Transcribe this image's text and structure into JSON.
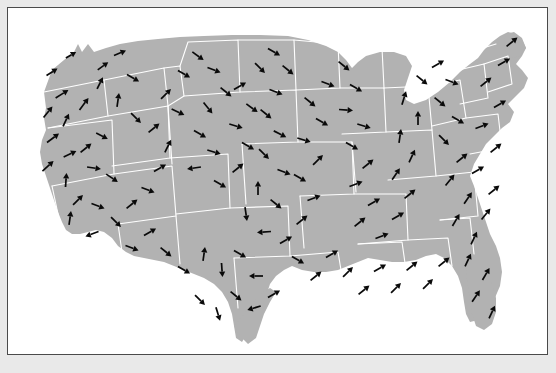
{
  "figure": {
    "title": "",
    "type": "vector-field-map",
    "region": "Contiguous United States",
    "background_color": "#e9e9e9",
    "panel_color": "#ffffff",
    "land_color": "#b2b2b2",
    "border_color": "#ffffff",
    "arrow_color": "#0a0a0a",
    "frame_color": "#4a4a4a",
    "panel": {
      "x": 7,
      "y": 7,
      "width": 541,
      "height": 348
    }
  },
  "chart_data": {
    "type": "quiver",
    "title": "",
    "xlabel": "",
    "ylabel": "",
    "legend": [],
    "grid": false,
    "units": "arbitrary vector units",
    "xlim": [
      0,
      539
    ],
    "ylim": [
      0,
      346
    ],
    "vectors": [
      {
        "x": 44,
        "y": 64,
        "dx": 11,
        "dy": -7,
        "len": 13
      },
      {
        "x": 63,
        "y": 47,
        "dx": 10,
        "dy": -6,
        "len": 12
      },
      {
        "x": 54,
        "y": 86,
        "dx": 13,
        "dy": -8,
        "len": 15
      },
      {
        "x": 40,
        "y": 104,
        "dx": 9,
        "dy": -11,
        "len": 14
      },
      {
        "x": 58,
        "y": 112,
        "dx": 6,
        "dy": -13,
        "len": 14
      },
      {
        "x": 76,
        "y": 96,
        "dx": 9,
        "dy": -12,
        "len": 15
      },
      {
        "x": 92,
        "y": 75,
        "dx": 6,
        "dy": -12,
        "len": 13
      },
      {
        "x": 95,
        "y": 58,
        "dx": 11,
        "dy": -8,
        "len": 13
      },
      {
        "x": 112,
        "y": 45,
        "dx": 12,
        "dy": -5,
        "len": 13
      },
      {
        "x": 125,
        "y": 70,
        "dx": 12,
        "dy": 7,
        "len": 14
      },
      {
        "x": 110,
        "y": 92,
        "dx": 2,
        "dy": -14,
        "len": 14
      },
      {
        "x": 128,
        "y": 110,
        "dx": 10,
        "dy": 10,
        "len": 14
      },
      {
        "x": 45,
        "y": 130,
        "dx": 12,
        "dy": -9,
        "len": 15
      },
      {
        "x": 62,
        "y": 146,
        "dx": 13,
        "dy": -6,
        "len": 14
      },
      {
        "x": 40,
        "y": 158,
        "dx": 11,
        "dy": -10,
        "len": 15
      },
      {
        "x": 58,
        "y": 172,
        "dx": 1,
        "dy": -14,
        "len": 14
      },
      {
        "x": 78,
        "y": 140,
        "dx": 11,
        "dy": -9,
        "len": 14
      },
      {
        "x": 94,
        "y": 128,
        "dx": 12,
        "dy": 6,
        "len": 13
      },
      {
        "x": 86,
        "y": 160,
        "dx": 14,
        "dy": 2,
        "len": 14
      },
      {
        "x": 104,
        "y": 170,
        "dx": 12,
        "dy": 8,
        "len": 14
      },
      {
        "x": 70,
        "y": 192,
        "dx": 10,
        "dy": -10,
        "len": 14
      },
      {
        "x": 90,
        "y": 198,
        "dx": 13,
        "dy": 5,
        "len": 14
      },
      {
        "x": 62,
        "y": 210,
        "dx": 2,
        "dy": -14,
        "len": 14
      },
      {
        "x": 84,
        "y": 226,
        "dx": -13,
        "dy": 5,
        "len": 14
      },
      {
        "x": 108,
        "y": 214,
        "dx": 10,
        "dy": 10,
        "len": 14
      },
      {
        "x": 124,
        "y": 196,
        "dx": 11,
        "dy": -9,
        "len": 14
      },
      {
        "x": 140,
        "y": 182,
        "dx": 13,
        "dy": 5,
        "len": 14
      },
      {
        "x": 152,
        "y": 160,
        "dx": 12,
        "dy": -7,
        "len": 14
      },
      {
        "x": 160,
        "y": 138,
        "dx": 6,
        "dy": -12,
        "len": 14
      },
      {
        "x": 146,
        "y": 120,
        "dx": 11,
        "dy": -9,
        "len": 14
      },
      {
        "x": 170,
        "y": 104,
        "dx": 13,
        "dy": 6,
        "len": 14
      },
      {
        "x": 158,
        "y": 86,
        "dx": 10,
        "dy": -10,
        "len": 14
      },
      {
        "x": 176,
        "y": 66,
        "dx": 12,
        "dy": 7,
        "len": 14
      },
      {
        "x": 190,
        "y": 48,
        "dx": 11,
        "dy": 8,
        "len": 14
      },
      {
        "x": 206,
        "y": 62,
        "dx": 13,
        "dy": 5,
        "len": 14
      },
      {
        "x": 218,
        "y": 84,
        "dx": 11,
        "dy": 9,
        "len": 14
      },
      {
        "x": 200,
        "y": 100,
        "dx": 9,
        "dy": 11,
        "len": 14
      },
      {
        "x": 192,
        "y": 126,
        "dx": 12,
        "dy": 7,
        "len": 14
      },
      {
        "x": 206,
        "y": 144,
        "dx": 13,
        "dy": 4,
        "len": 14
      },
      {
        "x": 186,
        "y": 160,
        "dx": -14,
        "dy": 2,
        "len": 14
      },
      {
        "x": 212,
        "y": 176,
        "dx": 12,
        "dy": 7,
        "len": 14
      },
      {
        "x": 230,
        "y": 160,
        "dx": 11,
        "dy": -9,
        "len": 14
      },
      {
        "x": 240,
        "y": 138,
        "dx": 12,
        "dy": 7,
        "len": 14
      },
      {
        "x": 228,
        "y": 118,
        "dx": 13,
        "dy": 4,
        "len": 14
      },
      {
        "x": 244,
        "y": 100,
        "dx": 11,
        "dy": 8,
        "len": 14
      },
      {
        "x": 232,
        "y": 78,
        "dx": 12,
        "dy": -7,
        "len": 14
      },
      {
        "x": 252,
        "y": 60,
        "dx": 10,
        "dy": 10,
        "len": 14
      },
      {
        "x": 266,
        "y": 44,
        "dx": 12,
        "dy": 7,
        "len": 14
      },
      {
        "x": 280,
        "y": 62,
        "dx": 11,
        "dy": 9,
        "len": 14
      },
      {
        "x": 268,
        "y": 84,
        "dx": 13,
        "dy": 5,
        "len": 14
      },
      {
        "x": 258,
        "y": 106,
        "dx": 11,
        "dy": 9,
        "len": 14
      },
      {
        "x": 272,
        "y": 126,
        "dx": 12,
        "dy": 6,
        "len": 14
      },
      {
        "x": 256,
        "y": 146,
        "dx": 10,
        "dy": 10,
        "len": 14
      },
      {
        "x": 276,
        "y": 164,
        "dx": 13,
        "dy": 5,
        "len": 14
      },
      {
        "x": 250,
        "y": 180,
        "dx": 0,
        "dy": -14,
        "len": 14
      },
      {
        "x": 268,
        "y": 196,
        "dx": 11,
        "dy": 9,
        "len": 14
      },
      {
        "x": 238,
        "y": 206,
        "dx": 2,
        "dy": 14,
        "len": 14
      },
      {
        "x": 256,
        "y": 224,
        "dx": -14,
        "dy": 1,
        "len": 14
      },
      {
        "x": 278,
        "y": 232,
        "dx": 12,
        "dy": -7,
        "len": 14
      },
      {
        "x": 294,
        "y": 212,
        "dx": 11,
        "dy": -9,
        "len": 14
      },
      {
        "x": 306,
        "y": 190,
        "dx": 13,
        "dy": -5,
        "len": 14
      },
      {
        "x": 292,
        "y": 170,
        "dx": 12,
        "dy": 7,
        "len": 14
      },
      {
        "x": 310,
        "y": 152,
        "dx": 10,
        "dy": -10,
        "len": 14
      },
      {
        "x": 296,
        "y": 132,
        "dx": 13,
        "dy": 4,
        "len": 14
      },
      {
        "x": 314,
        "y": 114,
        "dx": 12,
        "dy": 7,
        "len": 14
      },
      {
        "x": 302,
        "y": 94,
        "dx": 11,
        "dy": 9,
        "len": 14
      },
      {
        "x": 320,
        "y": 76,
        "dx": 13,
        "dy": 5,
        "len": 14
      },
      {
        "x": 336,
        "y": 58,
        "dx": 11,
        "dy": 9,
        "len": 14
      },
      {
        "x": 348,
        "y": 80,
        "dx": 12,
        "dy": 7,
        "len": 14
      },
      {
        "x": 338,
        "y": 102,
        "dx": 14,
        "dy": 1,
        "len": 14
      },
      {
        "x": 356,
        "y": 118,
        "dx": 13,
        "dy": 4,
        "len": 14
      },
      {
        "x": 344,
        "y": 138,
        "dx": 12,
        "dy": 7,
        "len": 14
      },
      {
        "x": 360,
        "y": 156,
        "dx": 11,
        "dy": -9,
        "len": 14
      },
      {
        "x": 348,
        "y": 176,
        "dx": 13,
        "dy": -5,
        "len": 14
      },
      {
        "x": 366,
        "y": 194,
        "dx": 12,
        "dy": -7,
        "len": 14
      },
      {
        "x": 352,
        "y": 214,
        "dx": 11,
        "dy": -9,
        "len": 14
      },
      {
        "x": 374,
        "y": 228,
        "dx": 13,
        "dy": -5,
        "len": 14
      },
      {
        "x": 390,
        "y": 208,
        "dx": 12,
        "dy": -7,
        "len": 14
      },
      {
        "x": 402,
        "y": 186,
        "dx": 11,
        "dy": -9,
        "len": 14
      },
      {
        "x": 388,
        "y": 166,
        "dx": 8,
        "dy": -12,
        "len": 14
      },
      {
        "x": 404,
        "y": 148,
        "dx": 6,
        "dy": -13,
        "len": 14
      },
      {
        "x": 392,
        "y": 128,
        "dx": 2,
        "dy": -14,
        "len": 14
      },
      {
        "x": 410,
        "y": 110,
        "dx": 0,
        "dy": -14,
        "len": 14
      },
      {
        "x": 396,
        "y": 90,
        "dx": 4,
        "dy": -13,
        "len": 14
      },
      {
        "x": 414,
        "y": 72,
        "dx": 11,
        "dy": 9,
        "len": 14
      },
      {
        "x": 430,
        "y": 56,
        "dx": 12,
        "dy": -7,
        "len": 14
      },
      {
        "x": 444,
        "y": 74,
        "dx": 13,
        "dy": 5,
        "len": 14
      },
      {
        "x": 432,
        "y": 94,
        "dx": 11,
        "dy": 9,
        "len": 14
      },
      {
        "x": 450,
        "y": 112,
        "dx": 12,
        "dy": 7,
        "len": 14
      },
      {
        "x": 436,
        "y": 132,
        "dx": 10,
        "dy": 10,
        "len": 14
      },
      {
        "x": 454,
        "y": 150,
        "dx": 11,
        "dy": -9,
        "len": 14
      },
      {
        "x": 442,
        "y": 172,
        "dx": 9,
        "dy": -11,
        "len": 14
      },
      {
        "x": 460,
        "y": 190,
        "dx": 8,
        "dy": -12,
        "len": 14
      },
      {
        "x": 448,
        "y": 212,
        "dx": 7,
        "dy": -12,
        "len": 14
      },
      {
        "x": 466,
        "y": 230,
        "dx": 6,
        "dy": -13,
        "len": 14
      },
      {
        "x": 478,
        "y": 206,
        "dx": 9,
        "dy": -11,
        "len": 14
      },
      {
        "x": 486,
        "y": 182,
        "dx": 11,
        "dy": -9,
        "len": 14
      },
      {
        "x": 470,
        "y": 162,
        "dx": 12,
        "dy": -7,
        "len": 14
      },
      {
        "x": 488,
        "y": 140,
        "dx": 11,
        "dy": -9,
        "len": 14
      },
      {
        "x": 474,
        "y": 118,
        "dx": 13,
        "dy": -5,
        "len": 14
      },
      {
        "x": 492,
        "y": 96,
        "dx": 12,
        "dy": -7,
        "len": 14
      },
      {
        "x": 478,
        "y": 74,
        "dx": 11,
        "dy": -9,
        "len": 14
      },
      {
        "x": 496,
        "y": 54,
        "dx": 12,
        "dy": -7,
        "len": 14
      },
      {
        "x": 504,
        "y": 34,
        "dx": 11,
        "dy": -9,
        "len": 14
      },
      {
        "x": 460,
        "y": 252,
        "dx": 6,
        "dy": -13,
        "len": 14
      },
      {
        "x": 478,
        "y": 266,
        "dx": 7,
        "dy": -12,
        "len": 14
      },
      {
        "x": 468,
        "y": 288,
        "dx": 8,
        "dy": -12,
        "len": 14
      },
      {
        "x": 484,
        "y": 304,
        "dx": 6,
        "dy": -13,
        "len": 14
      },
      {
        "x": 124,
        "y": 240,
        "dx": 13,
        "dy": 5,
        "len": 14
      },
      {
        "x": 142,
        "y": 224,
        "dx": 12,
        "dy": -7,
        "len": 14
      },
      {
        "x": 158,
        "y": 244,
        "dx": 11,
        "dy": 9,
        "len": 14
      },
      {
        "x": 176,
        "y": 262,
        "dx": 12,
        "dy": 7,
        "len": 14
      },
      {
        "x": 196,
        "y": 246,
        "dx": 2,
        "dy": -14,
        "len": 14
      },
      {
        "x": 214,
        "y": 262,
        "dx": 1,
        "dy": 14,
        "len": 14
      },
      {
        "x": 232,
        "y": 246,
        "dx": 12,
        "dy": 7,
        "len": 14
      },
      {
        "x": 248,
        "y": 268,
        "dx": -14,
        "dy": 0,
        "len": 14
      },
      {
        "x": 266,
        "y": 286,
        "dx": 12,
        "dy": -7,
        "len": 14
      },
      {
        "x": 246,
        "y": 300,
        "dx": -13,
        "dy": 4,
        "len": 14
      },
      {
        "x": 228,
        "y": 288,
        "dx": 11,
        "dy": 9,
        "len": 14
      },
      {
        "x": 210,
        "y": 306,
        "dx": 4,
        "dy": 13,
        "len": 14
      },
      {
        "x": 192,
        "y": 292,
        "dx": 10,
        "dy": 10,
        "len": 14
      },
      {
        "x": 290,
        "y": 252,
        "dx": 12,
        "dy": 7,
        "len": 14
      },
      {
        "x": 308,
        "y": 268,
        "dx": 11,
        "dy": -9,
        "len": 14
      },
      {
        "x": 324,
        "y": 246,
        "dx": 12,
        "dy": -7,
        "len": 14
      },
      {
        "x": 340,
        "y": 264,
        "dx": 10,
        "dy": -10,
        "len": 14
      },
      {
        "x": 356,
        "y": 282,
        "dx": 11,
        "dy": -9,
        "len": 14
      },
      {
        "x": 372,
        "y": 260,
        "dx": 12,
        "dy": -7,
        "len": 14
      },
      {
        "x": 388,
        "y": 280,
        "dx": 10,
        "dy": -10,
        "len": 14
      },
      {
        "x": 404,
        "y": 258,
        "dx": 11,
        "dy": -9,
        "len": 14
      },
      {
        "x": 420,
        "y": 276,
        "dx": 10,
        "dy": -10,
        "len": 14
      },
      {
        "x": 436,
        "y": 254,
        "dx": 11,
        "dy": -9,
        "len": 14
      }
    ],
    "arrow_count": 131
  }
}
